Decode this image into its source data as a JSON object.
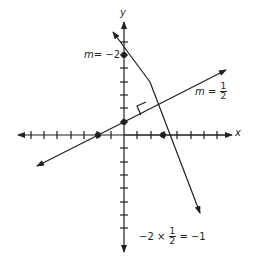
{
  "axes": {
    "x_label": "x",
    "y_label": "y",
    "x_ticks": [
      -8,
      -7,
      -6,
      -5,
      -4,
      -3,
      -2,
      -1,
      1,
      2,
      3,
      4,
      5,
      6,
      7,
      8
    ],
    "y_ticks": [
      -8,
      -7,
      -6,
      -5,
      -4,
      -3,
      -2,
      -1,
      1,
      2,
      3,
      4,
      5,
      6,
      7,
      8
    ]
  },
  "lines": [
    {
      "name": "steep-line",
      "slope_label_m": "m",
      "slope_label_eq": "= −2",
      "y_intercept": 6,
      "x_intercept": 3
    },
    {
      "name": "shallow-line",
      "slope_label_m": "m",
      "slope_label_eq": "=",
      "slope_num": "1",
      "slope_den": "2",
      "y_intercept": 1,
      "x_intercept": -2
    }
  ],
  "product": {
    "left": "−2 ×",
    "num": "1",
    "den": "2",
    "right": "= −1"
  },
  "colors": {
    "ink": "#231f20"
  }
}
